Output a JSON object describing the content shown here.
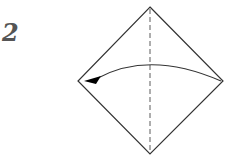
{
  "step": {
    "number": "2"
  },
  "diagram": {
    "shape": "square-diamond",
    "vertices": {
      "top": [
        150,
        7
      ],
      "right": [
        223,
        81
      ],
      "bottom": [
        150,
        154
      ],
      "left": [
        78,
        81
      ]
    },
    "fold_line": {
      "type": "valley-dashed",
      "orientation": "vertical"
    },
    "arrow": {
      "from": "right-corner",
      "to": "left-corner",
      "meaning": "fold right corner to left"
    },
    "colors": {
      "line": "#333333",
      "dash": "#777777",
      "arrowhead": "#000000",
      "step_number": "#555555"
    }
  }
}
